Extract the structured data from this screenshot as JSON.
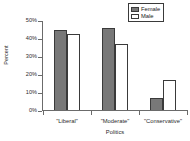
{
  "chart_data": {
    "type": "bar",
    "title": "",
    "xlabel": "Politics",
    "ylabel": "Percent",
    "categories": [
      "\"Liberal\"",
      "\"Moderate\"",
      "\"Conservative\""
    ],
    "series": [
      {
        "name": "Female",
        "color": "#787878",
        "values": [
          45,
          46,
          7.5
        ]
      },
      {
        "name": "Male",
        "color": "#ffffff",
        "values": [
          43,
          37.5,
          17.5
        ]
      }
    ],
    "ylim": [
      0,
      50
    ],
    "yticks": [
      0,
      10,
      20,
      30,
      40,
      50
    ],
    "ytick_labels": [
      "0%",
      "10%",
      "20%",
      "30%",
      "40%",
      "50%"
    ],
    "grid": false,
    "legend_position": "top-right"
  },
  "legend": {
    "entries": [
      {
        "label": "Female",
        "swatch": "female"
      },
      {
        "label": "Male",
        "swatch": "male"
      }
    ]
  },
  "axes": {
    "y_title": "Percent",
    "x_title": "Politics"
  }
}
